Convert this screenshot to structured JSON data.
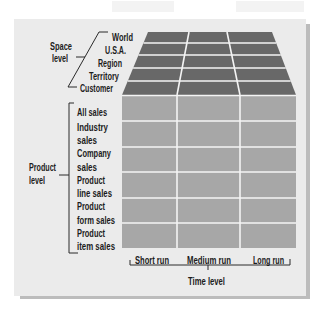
{
  "diagram": {
    "space_level": {
      "label_line1": "Space",
      "label_line2": "level",
      "items": [
        "World",
        "U.S.A.",
        "Region",
        "Territory",
        "Customer"
      ]
    },
    "product_level": {
      "label_line1": "Product",
      "label_line2": "level",
      "items": [
        [
          "All sales"
        ],
        [
          "Industry",
          "sales"
        ],
        [
          "Company",
          "sales"
        ],
        [
          "Product",
          "line sales"
        ],
        [
          "Product",
          "form sales"
        ],
        [
          "Product",
          "item sales"
        ]
      ]
    },
    "time_level": {
      "label": "Time level",
      "items": [
        "Short run",
        "Medium run",
        "Long run"
      ]
    },
    "grid": {
      "space_rows": 5,
      "product_rows": 6,
      "time_columns": 3
    }
  },
  "colors": {
    "panel": "#ebebeb",
    "panel_shadow": "#bcbcbc",
    "top_face": "#686868",
    "front_face": "#a7a7a7",
    "grid_lines": "#f4f4f4",
    "text": "#1c1c1c"
  }
}
